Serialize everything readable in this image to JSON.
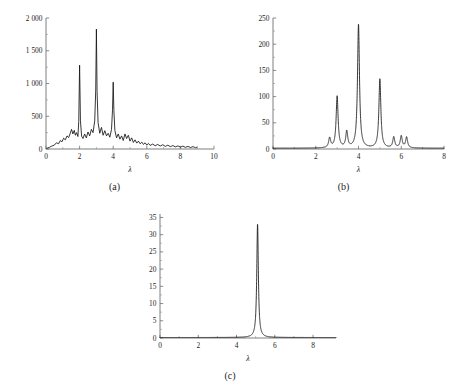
{
  "figure": {
    "background_color": "#ffffff",
    "curve_color": "#141414",
    "axis_color": "#6f6f6f",
    "panels": [
      {
        "id": "a",
        "caption": "(a)"
      },
      {
        "id": "b",
        "caption": "(b)"
      },
      {
        "id": "c",
        "caption": "(c)"
      }
    ]
  },
  "chart_data": [
    {
      "id": "a",
      "type": "line",
      "title": "",
      "caption": "(a)",
      "xlabel": "λ",
      "ylabel": "",
      "xlim": [
        0,
        10
      ],
      "ylim": [
        0,
        2000
      ],
      "xticks": [
        0,
        2,
        4,
        6,
        8,
        10
      ],
      "xticklabels": [
        "0",
        "2",
        "4",
        "6",
        "8",
        "10"
      ],
      "yticks": [
        0,
        500,
        1000,
        1500,
        2000
      ],
      "yticklabels": [
        "0",
        "500",
        "1 000",
        "1 500",
        "2 000"
      ],
      "grid": false,
      "legend": null,
      "data_range_x": [
        0.05,
        9.0
      ],
      "peaks": [
        {
          "x": 2.0,
          "y": 1280
        },
        {
          "x": 3.0,
          "y": 1830
        },
        {
          "x": 4.0,
          "y": 1020
        }
      ],
      "x": [
        0.05,
        0.2,
        0.35,
        0.5,
        0.62,
        0.75,
        0.85,
        0.95,
        1.05,
        1.15,
        1.25,
        1.35,
        1.45,
        1.52,
        1.6,
        1.68,
        1.75,
        1.82,
        1.9,
        1.95,
        2.0,
        2.05,
        2.12,
        2.2,
        2.3,
        2.4,
        2.5,
        2.6,
        2.7,
        2.8,
        2.9,
        2.96,
        3.0,
        3.04,
        3.1,
        3.2,
        3.3,
        3.4,
        3.5,
        3.6,
        3.7,
        3.8,
        3.9,
        3.96,
        4.0,
        4.04,
        4.1,
        4.2,
        4.3,
        4.4,
        4.5,
        4.6,
        4.7,
        4.8,
        4.9,
        5.0,
        5.1,
        5.2,
        5.3,
        5.4,
        5.5,
        5.6,
        5.7,
        5.8,
        5.9,
        6.0,
        6.1,
        6.2,
        6.35,
        6.5,
        6.65,
        6.8,
        6.95,
        7.1,
        7.25,
        7.4,
        7.55,
        7.7,
        7.85,
        8.0,
        8.15,
        8.3,
        8.45,
        8.6,
        8.75,
        8.9,
        9.0
      ],
      "y": [
        10,
        25,
        45,
        60,
        95,
        80,
        130,
        110,
        165,
        140,
        200,
        175,
        245,
        300,
        230,
        285,
        210,
        250,
        190,
        420,
        1280,
        430,
        195,
        160,
        230,
        170,
        260,
        200,
        300,
        250,
        430,
        900,
        1830,
        880,
        400,
        240,
        330,
        210,
        280,
        200,
        240,
        180,
        300,
        600,
        1020,
        590,
        280,
        170,
        230,
        150,
        200,
        130,
        230,
        160,
        210,
        120,
        170,
        100,
        140,
        90,
        120,
        80,
        105,
        70,
        95,
        60,
        85,
        55,
        75,
        50,
        70,
        45,
        65,
        40,
        58,
        36,
        52,
        32,
        48,
        28,
        44,
        25,
        40,
        22,
        36,
        20,
        30
      ]
    },
    {
      "id": "b",
      "type": "line",
      "title": "",
      "caption": "(b)",
      "xlabel": "λ",
      "ylabel": "",
      "xlim": [
        0,
        8
      ],
      "ylim": [
        0,
        250
      ],
      "xticks": [
        0,
        2,
        4,
        6,
        8
      ],
      "xticklabels": [
        "0",
        "2",
        "4",
        "6",
        "8"
      ],
      "yticks": [
        0,
        50,
        100,
        150,
        200,
        250
      ],
      "yticklabels": [
        "0",
        "50",
        "100",
        "150",
        "200",
        "250"
      ],
      "grid": false,
      "legend": null,
      "data_range_x": [
        0.0,
        8.0
      ],
      "peaks": [
        {
          "x": 2.65,
          "y": 20
        },
        {
          "x": 3.0,
          "y": 100
        },
        {
          "x": 3.45,
          "y": 32
        },
        {
          "x": 4.0,
          "y": 237
        },
        {
          "x": 5.0,
          "y": 133
        },
        {
          "x": 5.65,
          "y": 22
        },
        {
          "x": 6.0,
          "y": 24
        },
        {
          "x": 6.25,
          "y": 22
        }
      ],
      "baseline": 1.5,
      "peak_halfwidth": 0.055
    },
    {
      "id": "c",
      "type": "line",
      "title": "",
      "caption": "(c)",
      "xlabel": "λ",
      "ylabel": "",
      "xlim": [
        0,
        9.2
      ],
      "ylim": [
        0,
        36
      ],
      "xticks": [
        0,
        2,
        4,
        6,
        8
      ],
      "xticklabels": [
        "0",
        "2",
        "4",
        "6",
        "8"
      ],
      "yticks": [
        0,
        5,
        10,
        15,
        20,
        25,
        30,
        35
      ],
      "yticklabels": [
        "0",
        "5",
        "10",
        "15",
        "20",
        "25",
        "30",
        "35"
      ],
      "grid": false,
      "legend": null,
      "data_range_x": [
        0.0,
        9.2
      ],
      "peaks": [
        {
          "x": 5.1,
          "y": 33
        }
      ],
      "baseline": 0.15,
      "peak_halfwidth": 0.05
    }
  ]
}
